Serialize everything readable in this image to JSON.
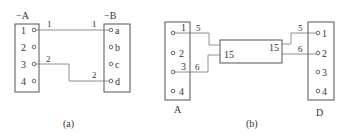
{
  "diagram_a": {
    "caption": "(a)",
    "left_block": {
      "label": "−A",
      "terminals": [
        "1",
        "2",
        "3",
        "4"
      ]
    },
    "right_block": {
      "label": "−B",
      "terminals": [
        "a",
        "b",
        "c",
        "d"
      ]
    },
    "wires": [
      {
        "from": "A:1",
        "to": "B:a",
        "label_left": "1",
        "label_right": "1"
      },
      {
        "from": "A:3",
        "to": "B:d",
        "label_left": "2",
        "label_right": "2"
      }
    ]
  },
  "diagram_b": {
    "caption": "(b)",
    "left_block": {
      "label": "A",
      "terminals": [
        "1",
        "2",
        "3",
        "4"
      ]
    },
    "right_block": {
      "label": "D",
      "terminals": [
        "1",
        "2",
        "3",
        "4"
      ]
    },
    "middle_block": {
      "left_label": "15",
      "right_label": "15"
    },
    "wires": [
      {
        "from": "A:1",
        "label": "5"
      },
      {
        "from": "A:3",
        "label": "6"
      },
      {
        "to": "D:1",
        "label": "5"
      },
      {
        "to": "D:2",
        "label": "6"
      }
    ]
  }
}
